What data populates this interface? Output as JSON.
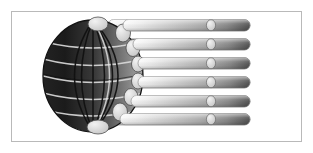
{
  "figure": {
    "style": "grayscale clip-art illustration",
    "canvas": {
      "width": 313,
      "height": 153,
      "background": "#ffffff"
    },
    "frame": {
      "label": "image border",
      "x": 11,
      "y": 11,
      "width": 291,
      "height": 131,
      "border_color": "#b9b9b9",
      "border_width": 1,
      "fill": "#ffffff"
    },
    "globe": {
      "label": "wireframe globe",
      "center_x": 93,
      "center_y": 76,
      "radius_x": 50,
      "radius_y": 56,
      "dark_color": "#1c1c1c",
      "mid_color": "#6e6e6e",
      "light_color": "#a8a8a8",
      "grid_color": "#d8d8d8",
      "outline_color": "#111111",
      "meridian_count": 7,
      "parallel_count": 5,
      "pole_node_color": "#d6d6d6"
    },
    "nodes": {
      "label": "light elliptical nodes on globe limb",
      "fill": "#d2d2d2",
      "stroke": "#555555",
      "count": 8
    },
    "bars": {
      "label": "radiating gradient bars",
      "count": 6,
      "height": 11,
      "gap": 8,
      "right_end": 250,
      "cap_radius": 6,
      "gradient_start": "#f2f2f2",
      "gradient_mid": "#bdbdbd",
      "gradient_end": "#5a5a5a",
      "edge_color": "#8c8c8c",
      "marker": {
        "label": "bar marker ellipse",
        "fill": "#dcdcdc",
        "stroke": "#6a6a6a",
        "center_x": 211,
        "radius_x": 5,
        "radius_y": 6
      },
      "items": [
        {
          "index": 1,
          "y": 25,
          "left": 108,
          "marker_x": 211
        },
        {
          "index": 2,
          "y": 44,
          "left": 117,
          "marker_x": 211
        },
        {
          "index": 3,
          "y": 63,
          "left": 122,
          "marker_x": 211
        },
        {
          "index": 4,
          "y": 82,
          "left": 122,
          "marker_x": 211
        },
        {
          "index": 5,
          "y": 101,
          "left": 117,
          "marker_x": 211
        },
        {
          "index": 6,
          "y": 119,
          "left": 108,
          "marker_x": 211
        }
      ]
    },
    "alt_text": "A dark wireframe globe on a white framed background with six horizontal gradient bars radiating to the right, each bar carrying a small light ellipse near its rounded end."
  }
}
